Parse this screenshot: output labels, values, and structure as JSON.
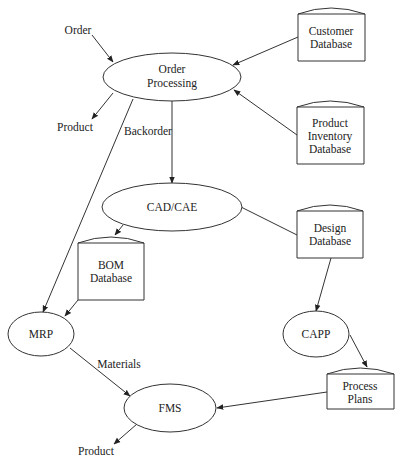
{
  "diagram": {
    "type": "data-flow",
    "processes": [
      {
        "id": "order_processing",
        "lines": [
          "Order",
          "Processing"
        ]
      },
      {
        "id": "cad_cae",
        "lines": [
          "CAD/CAE"
        ]
      },
      {
        "id": "mrp",
        "lines": [
          "MRP"
        ]
      },
      {
        "id": "capp",
        "lines": [
          "CAPP"
        ]
      },
      {
        "id": "fms",
        "lines": [
          "FMS"
        ]
      }
    ],
    "datastores": [
      {
        "id": "customer_db",
        "lines": [
          "Customer",
          "Database"
        ]
      },
      {
        "id": "product_inventory_db",
        "lines": [
          "Product",
          "Inventory",
          "Database"
        ]
      },
      {
        "id": "design_db",
        "lines": [
          "Design",
          "Database"
        ]
      },
      {
        "id": "bom_db",
        "lines": [
          "BOM",
          "Database"
        ]
      },
      {
        "id": "process_plans",
        "lines": [
          "Process",
          "Plans"
        ]
      }
    ],
    "terminals": [
      {
        "id": "order_in",
        "label": "Order"
      },
      {
        "id": "product_out_top",
        "label": "Product"
      },
      {
        "id": "product_out_bottom",
        "label": "Product"
      }
    ],
    "edge_labels": {
      "backorder": "Backorder",
      "materials": "Materials"
    },
    "edges": [
      {
        "from": "order_in",
        "to": "order_processing",
        "label": ""
      },
      {
        "from": "order_processing",
        "to": "product_out_top",
        "label": ""
      },
      {
        "from": "customer_db",
        "to": "order_processing",
        "label": ""
      },
      {
        "from": "product_inventory_db",
        "to": "order_processing",
        "label": ""
      },
      {
        "from": "order_processing",
        "to": "cad_cae",
        "label": "Backorder"
      },
      {
        "from": "order_processing",
        "to": "mrp",
        "label": ""
      },
      {
        "from": "cad_cae",
        "to": "bom_db",
        "label": ""
      },
      {
        "from": "cad_cae",
        "to": "design_db",
        "label": ""
      },
      {
        "from": "bom_db",
        "to": "mrp",
        "label": ""
      },
      {
        "from": "design_db",
        "to": "capp",
        "label": ""
      },
      {
        "from": "capp",
        "to": "process_plans",
        "label": ""
      },
      {
        "from": "mrp",
        "to": "fms",
        "label": "Materials"
      },
      {
        "from": "process_plans",
        "to": "fms",
        "label": ""
      },
      {
        "from": "fms",
        "to": "product_out_bottom",
        "label": ""
      }
    ]
  }
}
